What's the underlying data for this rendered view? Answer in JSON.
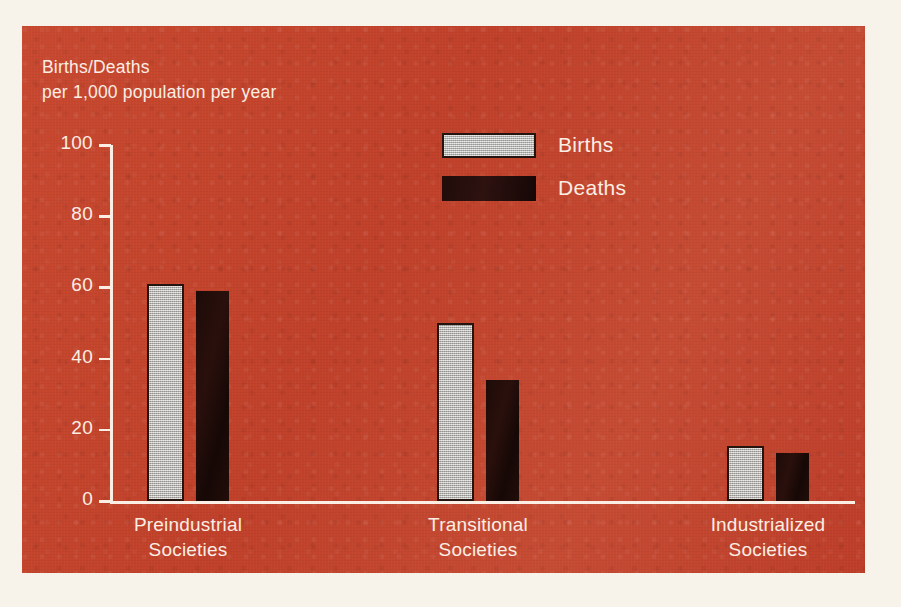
{
  "chart_data": {
    "type": "bar",
    "title": "",
    "ylabel": "Births/Deaths per 1,000 population per year",
    "ylabel_line1": "Births/Deaths",
    "ylabel_line2": "per 1,000 population per year",
    "xlabel": "",
    "categories": [
      "Preindustrial Societies",
      "Transitional Societies",
      "Industrialized Societies"
    ],
    "category_lines": [
      {
        "line1": "Preindustrial",
        "line2": "Societies"
      },
      {
        "line1": "Transitional",
        "line2": "Societies"
      },
      {
        "line1": "Industrialized",
        "line2": "Societies"
      }
    ],
    "series": [
      {
        "name": "Births",
        "values": [
          61,
          50,
          15.5
        ],
        "color": "#b7b6b1"
      },
      {
        "name": "Deaths",
        "values": [
          59,
          34,
          13.5
        ],
        "color": "#190a07"
      }
    ],
    "ylim": [
      0,
      100
    ],
    "yticks": [
      0,
      20,
      40,
      60,
      80,
      100
    ],
    "ytick_labels": [
      "0",
      "20",
      "40",
      "60",
      "80",
      "100"
    ],
    "grid": false,
    "legend_position": "top-center",
    "legend": [
      "Births",
      "Deaths"
    ],
    "background_color": "#c4452f",
    "text_color": "#fbeee4",
    "axis_color": "#fbeee4"
  },
  "legend": {
    "births_label": "Births",
    "deaths_label": "Deaths"
  }
}
